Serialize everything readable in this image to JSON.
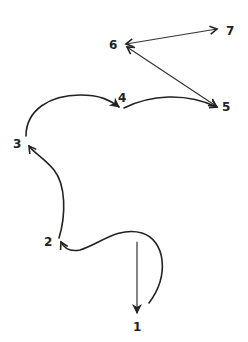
{
  "diagram": {
    "type": "path-sequence",
    "nodes": [
      {
        "id": "1",
        "label": "1",
        "x": 137,
        "y": 330
      },
      {
        "id": "2",
        "label": "2",
        "x": 49,
        "y": 245
      },
      {
        "id": "3",
        "label": "3",
        "x": 18,
        "y": 146
      },
      {
        "id": "4",
        "label": "4",
        "x": 122,
        "y": 100
      },
      {
        "id": "5",
        "label": "5",
        "x": 227,
        "y": 110
      },
      {
        "id": "6",
        "label": "6",
        "x": 114,
        "y": 48
      },
      {
        "id": "7",
        "label": "7",
        "x": 230,
        "y": 34
      }
    ],
    "edges": [
      {
        "from": "start",
        "to": "1",
        "style": "straight"
      },
      {
        "from": "start-curve",
        "to": "2",
        "style": "curved"
      },
      {
        "from": "2",
        "to": "3",
        "style": "curved"
      },
      {
        "from": "3",
        "to": "4",
        "style": "curved"
      },
      {
        "from": "4",
        "to": "5",
        "style": "curved"
      },
      {
        "from": "5",
        "to": "6",
        "style": "straight",
        "bidirectional": true
      },
      {
        "from": "6",
        "to": "7",
        "style": "straight",
        "bidirectional": true
      }
    ],
    "colors": {
      "ink": "#222222",
      "background": "#ffffff"
    }
  }
}
